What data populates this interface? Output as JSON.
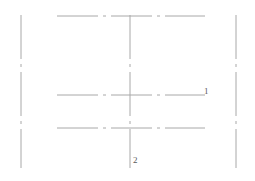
{
  "figure": {
    "type": "technical-line-drawing",
    "width": 255,
    "height": 181,
    "background_color": "#ffffff",
    "line_color": "#a8a8a8",
    "line_width": 1,
    "dash_pattern": "44 5 3 5",
    "label_color": "#5a5a5a"
  },
  "lines": {
    "vertical": [
      {
        "name": "left-vertical-line",
        "x": 21,
        "y1": 15,
        "y2": 168
      },
      {
        "name": "center-vertical-line",
        "x": 130,
        "y1": 15,
        "y2": 168
      },
      {
        "name": "right-vertical-line",
        "x": 236,
        "y1": 15,
        "y2": 168
      }
    ],
    "horizontal": [
      {
        "name": "top-horizontal-line",
        "y": 16,
        "x1": 57,
        "x2": 205
      },
      {
        "name": "middle-horizontal-line",
        "y": 95,
        "x1": 57,
        "x2": 205
      },
      {
        "name": "bottom-horizontal-line",
        "y": 128,
        "x1": 57,
        "x2": 205
      }
    ]
  },
  "labels": [
    {
      "name": "label-1",
      "text": "1",
      "x": 204,
      "y": 87
    },
    {
      "name": "label-2",
      "text": "2",
      "x": 133,
      "y": 156
    }
  ]
}
